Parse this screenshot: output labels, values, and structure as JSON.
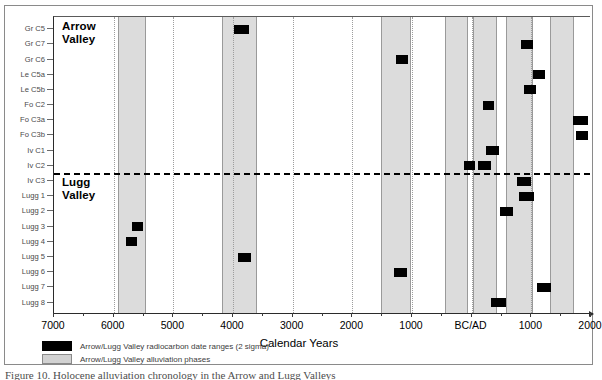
{
  "figure": {
    "caption": "Figure 10. Holocene alluviation chronology in the Arrow and Lugg Valleys",
    "axis_title": "Calendar Years",
    "group_labels": {
      "upper": "Arrow\nValley",
      "lower": "Lugg\nValley"
    }
  },
  "legend": {
    "items": [
      {
        "swatch": "black",
        "label": "Arrow/Lugg Valley radiocarbon date ranges (2 sigma)"
      },
      {
        "swatch": "gray",
        "label": "Arrow/Lugg Valley alluviation phases"
      }
    ]
  },
  "colors": {
    "bar": "#000000",
    "band": "#dcdcdc",
    "band_border": "#9a9a9a",
    "axis": "#2b2b2b",
    "grid": "#9d9d9d",
    "divider": "#000000"
  },
  "chart_data": {
    "type": "bar",
    "orientation": "horizontal",
    "title": "Holocene alluviation chronology in the Arrow and Lugg Valleys",
    "xlabel": "Calendar Years",
    "ylabel": "",
    "grid": true,
    "legend_position": "bottom-left",
    "x_axis": {
      "tick_labels": [
        "7000",
        "6000",
        "5000",
        "4000",
        "3000",
        "2000",
        "1000",
        "BC/AD",
        "1000",
        "2000"
      ],
      "tick_values": [
        -7000,
        -6000,
        -5000,
        -4000,
        -3000,
        -2000,
        -1000,
        0,
        1000,
        2000
      ],
      "xlim": [
        -7000,
        2000
      ],
      "note": "Labels left of BC/AD are years BC; right of BC/AD are years AD"
    },
    "categories": [
      "Gr C5",
      "Gr C7",
      "Gr C6",
      "Le C5a",
      "Le C5b",
      "Fo C2",
      "Fo C3a",
      "Fo C3b",
      "Iv C1",
      "Iv C2",
      "Iv C3",
      "Lugg 1",
      "Lugg 2",
      "Lugg 3",
      "Lugg 4",
      "Lugg 5",
      "Lugg 6",
      "Lugg 7",
      "Lugg 8"
    ],
    "group_divider_after": "Iv C2",
    "series": [
      {
        "name": "Arrow/Lugg Valley radiocarbon date ranges (2 sigma)",
        "color": "#000000",
        "type": "range-bars",
        "bars": [
          {
            "category": "Gr C5",
            "start": -3980,
            "end": -3740
          },
          {
            "category": "Gr C7",
            "start": 820,
            "end": 1030
          },
          {
            "category": "Gr C6",
            "start": -1270,
            "end": -1060
          },
          {
            "category": "Le C5a",
            "start": 1020,
            "end": 1230
          },
          {
            "category": "Le C5b",
            "start": 880,
            "end": 1080
          },
          {
            "category": "Fo C2",
            "start": 190,
            "end": 380
          },
          {
            "category": "Fo C3a",
            "start": 1700,
            "end": 1950
          },
          {
            "category": "Fo C3b",
            "start": 1750,
            "end": 1950
          },
          {
            "category": "Iv C1",
            "start": 240,
            "end": 450
          },
          {
            "category": "Iv C2",
            "start": -130,
            "end": 60
          },
          {
            "category": "Iv C2",
            "start": 100,
            "end": 330
          },
          {
            "category": "Iv C3",
            "start": 760,
            "end": 1000
          },
          {
            "category": "Lugg 1",
            "start": 800,
            "end": 1040
          },
          {
            "category": "Lugg 2",
            "start": 480,
            "end": 700
          },
          {
            "category": "Lugg 3",
            "start": -5690,
            "end": -5500
          },
          {
            "category": "Lugg 4",
            "start": -5790,
            "end": -5610
          },
          {
            "category": "Lugg 5",
            "start": -3910,
            "end": -3690
          },
          {
            "category": "Lugg 6",
            "start": -1310,
            "end": -1080
          },
          {
            "category": "Lugg 7",
            "start": 1090,
            "end": 1330
          },
          {
            "category": "Lugg 8",
            "start": 320,
            "end": 580
          }
        ]
      },
      {
        "name": "Arrow/Lugg Valley alluviation phases",
        "color": "#dcdcdc",
        "type": "vertical-bands",
        "bands": [
          {
            "start": -5930,
            "end": -5450
          },
          {
            "start": -4180,
            "end": -3600
          },
          {
            "start": -1520,
            "end": -1010
          },
          {
            "start": -450,
            "end": -60
          },
          {
            "start": 20,
            "end": 430
          },
          {
            "start": 570,
            "end": 1020
          },
          {
            "start": 1320,
            "end": 1720
          }
        ]
      }
    ]
  }
}
